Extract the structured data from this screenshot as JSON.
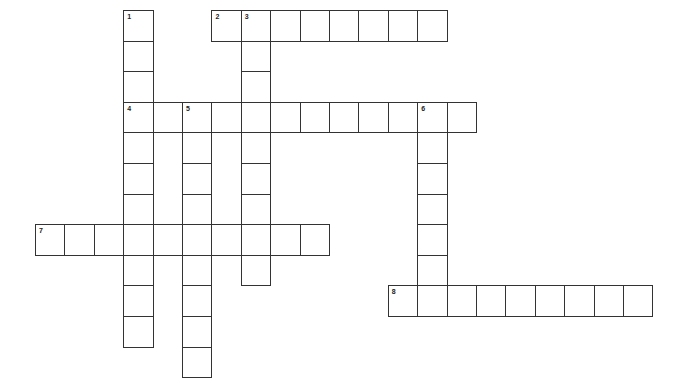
{
  "puzzle": {
    "type": "crossword",
    "grid": {
      "origin_x": 35,
      "origin_y": 10,
      "cell_w": 29.4,
      "cell_h": 30.6,
      "line_color": "#333333",
      "background": "#ffffff"
    },
    "entries": [
      {
        "number": "1",
        "direction": "down",
        "row": 0,
        "col": 3,
        "length": 11
      },
      {
        "number": "2",
        "direction": "across",
        "row": 0,
        "col": 6,
        "length": 8
      },
      {
        "number": "3",
        "direction": "down",
        "row": 0,
        "col": 7,
        "length": 9
      },
      {
        "number": "4",
        "direction": "across",
        "row": 3,
        "col": 3,
        "length": 12
      },
      {
        "number": "5",
        "direction": "down",
        "row": 3,
        "col": 5,
        "length": 9
      },
      {
        "number": "6",
        "direction": "down",
        "row": 3,
        "col": 13,
        "length": 7
      },
      {
        "number": "7",
        "direction": "across",
        "row": 7,
        "col": 0,
        "length": 10
      },
      {
        "number": "8",
        "direction": "across",
        "row": 9,
        "col": 12,
        "length": 9
      }
    ]
  }
}
